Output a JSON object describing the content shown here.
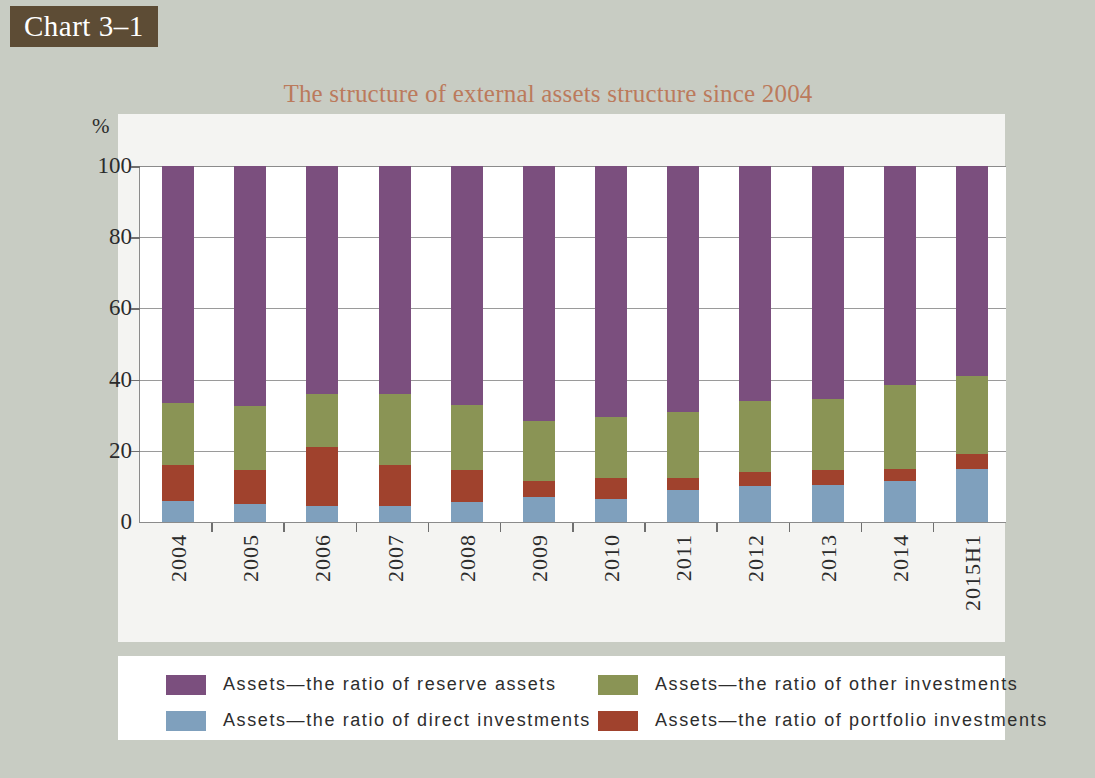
{
  "chart_tag": "Chart 3–1",
  "figure": {
    "title": "The structure of external assets structure since 2004",
    "title_color": "#bb7a5c",
    "background": "#c8ccc3",
    "panel_background": "#f4f4f2"
  },
  "axes": {
    "y_unit": "%",
    "y_ticks": [
      "0",
      "20",
      "40",
      "60",
      "80",
      "100"
    ]
  },
  "legend": {
    "items": [
      {
        "label": "Assets—the ratio of reserve assets",
        "color": "#7b4f7e"
      },
      {
        "label": "Assets—the ratio of other investments",
        "color": "#8a9455"
      },
      {
        "label": "Assets—the ratio of direct investments",
        "color": "#7fa0bd"
      },
      {
        "label": "Assets—the ratio of portfolio investments",
        "color": "#a0422d"
      }
    ]
  },
  "chart_data": {
    "type": "bar",
    "subtype": "stacked-100",
    "title": "The structure of external assets structure since 2004",
    "xlabel": "",
    "ylabel": "%",
    "ylim": [
      0,
      100
    ],
    "yticks": [
      0,
      20,
      40,
      60,
      80,
      100
    ],
    "grid": true,
    "legend_position": "bottom",
    "categories": [
      "2004",
      "2005",
      "2006",
      "2007",
      "2008",
      "2009",
      "2010",
      "2011",
      "2012",
      "2013",
      "2014",
      "2015H1"
    ],
    "series": [
      {
        "name": "Assets—the ratio of direct investments",
        "color": "#7fa0bd",
        "values": [
          6,
          5,
          4.5,
          4.5,
          5.5,
          7,
          6.5,
          9,
          10,
          10.5,
          11.5,
          15
        ]
      },
      {
        "name": "Assets—the ratio of portfolio investments",
        "color": "#a0422d",
        "values": [
          10,
          9.5,
          16.5,
          11.5,
          9,
          4.5,
          6,
          3.5,
          4,
          4,
          3.5,
          4
        ]
      },
      {
        "name": "Assets—the ratio of other investments",
        "color": "#8a9455",
        "values": [
          17.5,
          18,
          15,
          20,
          18.5,
          17,
          17,
          18.5,
          20,
          20,
          23.5,
          22
        ]
      },
      {
        "name": "Assets—the ratio of reserve assets",
        "color": "#7b4f7e",
        "values": [
          66.5,
          67.5,
          64,
          64,
          67,
          71.5,
          70.5,
          69,
          66,
          65.5,
          61.5,
          59
        ]
      }
    ]
  }
}
